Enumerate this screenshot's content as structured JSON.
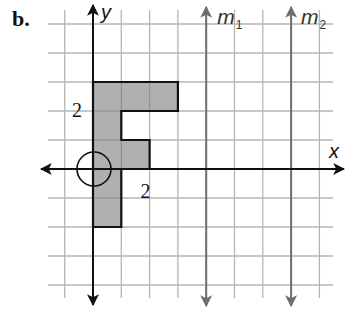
{
  "part_label": "b.",
  "axes": {
    "x_label": "x",
    "y_label": "y",
    "origin_px": [
      93,
      169
    ],
    "unit_px": [
      28.3,
      29.0
    ],
    "x_range_units": [
      -1.6,
      8.5
    ],
    "y_range_units": [
      5.5,
      -4.6
    ]
  },
  "grid": {
    "x_lines_units": [
      -1,
      0,
      1,
      2,
      3,
      4,
      5,
      6,
      7,
      8
    ],
    "y_lines_units": [
      5,
      4,
      3,
      2,
      1,
      0,
      -1,
      -2,
      -3,
      -4
    ],
    "color": "#b5b5b5"
  },
  "tick_labels": [
    {
      "text": "2",
      "axis": "y",
      "value": 2
    },
    {
      "text": "2",
      "axis": "x",
      "value": 2
    }
  ],
  "figure": {
    "name": "F-shape",
    "fill": "#a9a9a9",
    "stroke": "#111111",
    "vertices_units": [
      [
        0,
        3
      ],
      [
        3,
        3
      ],
      [
        3,
        2
      ],
      [
        1,
        2
      ],
      [
        1,
        1
      ],
      [
        2,
        1
      ],
      [
        2,
        0
      ],
      [
        1,
        0
      ],
      [
        1,
        -2
      ],
      [
        0,
        -2
      ]
    ]
  },
  "center_of_rotation": {
    "point_units": [
      0,
      0
    ],
    "radius_units": 0.6,
    "marker": "circle"
  },
  "reflection_lines": [
    {
      "name": "m",
      "subscript": "1",
      "x_units": 4,
      "color": "#6e6e6e"
    },
    {
      "name": "m",
      "subscript": "2",
      "x_units": 7,
      "color": "#6e6e6e"
    }
  ]
}
